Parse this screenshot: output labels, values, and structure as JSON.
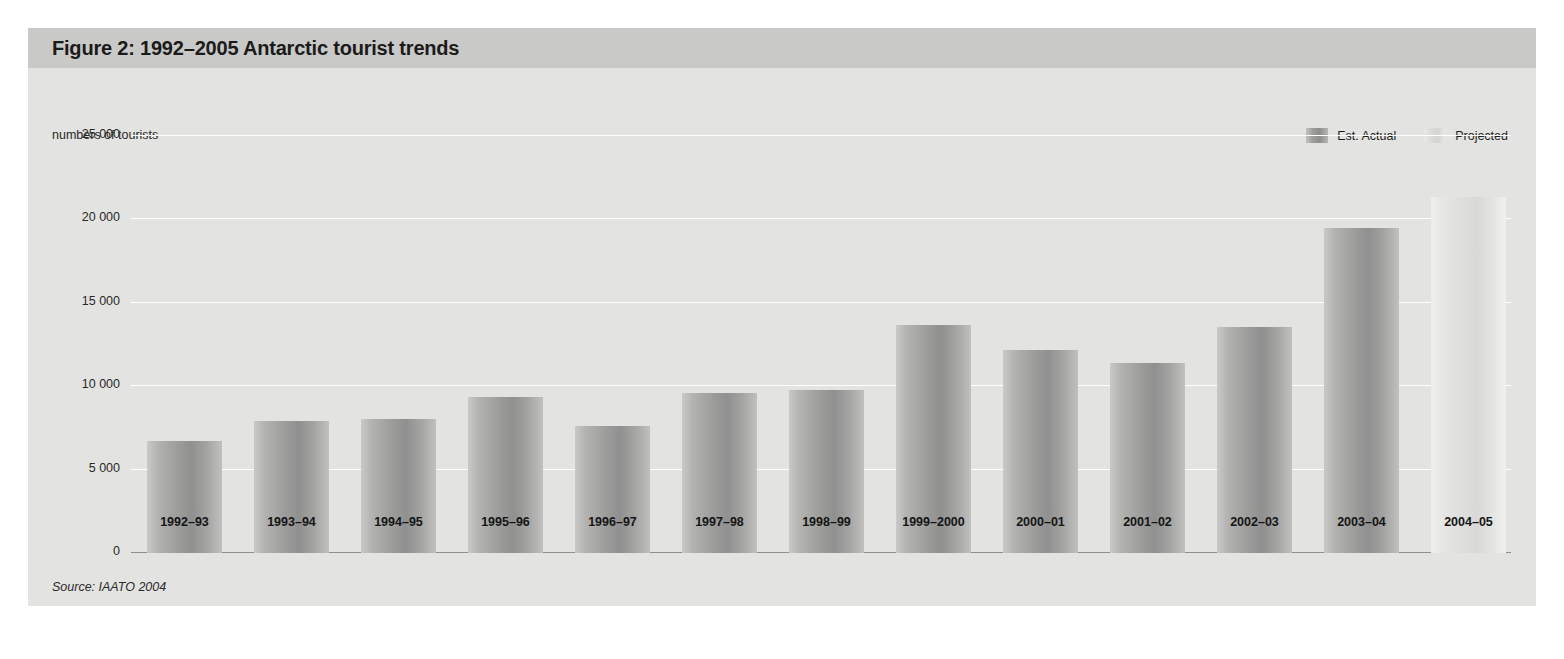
{
  "figure": {
    "title": "Figure 2: 1992–2005 Antarctic tourist trends",
    "source": "Source:  IAATO 2004",
    "colors": {
      "panel_background": "#e3e3e1",
      "title_bar": "#c9c9c7",
      "gridline": "#ffffff",
      "baseline": "#8f8f8d",
      "est_actual_bar": "#9c9c9a",
      "projected_bar": "#dddddb",
      "text": "#1b1b1b"
    }
  },
  "legend": {
    "position": "top-right",
    "items": [
      {
        "label": "Est. Actual",
        "key": "est_actual",
        "color": "#9c9c9a"
      },
      {
        "label": "Projected",
        "key": "projected",
        "color": "#dddddb"
      }
    ]
  },
  "chart_data": {
    "type": "bar",
    "title": "Figure 2: 1992–2005 Antarctic tourist trends",
    "xlabel": "",
    "ylabel": "numbers of tourists",
    "ylim": [
      0,
      25000
    ],
    "yticks": [
      0,
      5000,
      10000,
      15000,
      20000,
      25000
    ],
    "ytick_labels": [
      "0",
      "5 000",
      "10 000",
      "15 000",
      "20 000",
      "25 000"
    ],
    "grid": true,
    "categories": [
      "1992–93",
      "1993–94",
      "1994–95",
      "1995–96",
      "1996–97",
      "1997–98",
      "1998–99",
      "1999–2000",
      "2000–01",
      "2001–02",
      "2002–03",
      "2003–04",
      "2004–05"
    ],
    "values": [
      6700,
      7900,
      8050,
      9350,
      7600,
      9600,
      9750,
      13650,
      12170,
      11380,
      13550,
      19500,
      21350
    ],
    "series_key": [
      "est_actual",
      "est_actual",
      "est_actual",
      "est_actual",
      "est_actual",
      "est_actual",
      "est_actual",
      "est_actual",
      "est_actual",
      "est_actual",
      "est_actual",
      "est_actual",
      "projected"
    ],
    "legend_entries": [
      "Est. Actual",
      "Projected"
    ],
    "annotations": [
      "Source:  IAATO 2004"
    ]
  }
}
